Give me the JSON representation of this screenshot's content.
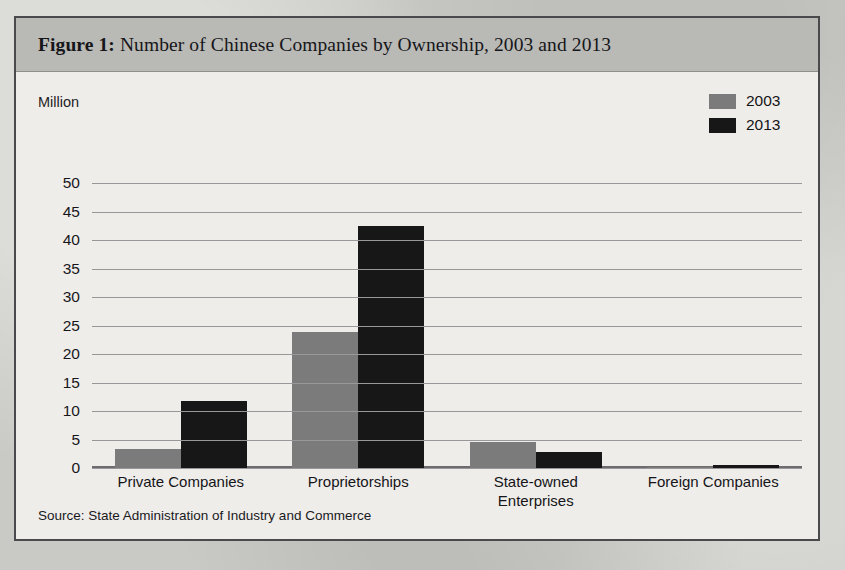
{
  "figure": {
    "label": "Figure 1:",
    "title": " Number of Chinese Companies by Ownership, 2003 and 2013",
    "unit_label": "Million",
    "source": "Source: State Administration of Industry and Commerce"
  },
  "legend": {
    "items": [
      {
        "label": "2003",
        "color": "#7b7b7b"
      },
      {
        "label": "2013",
        "color": "#171717"
      }
    ]
  },
  "chart_data": {
    "type": "bar",
    "title": "Figure 1: Number of Chinese Companies by Ownership, 2003 and 2013",
    "xlabel": "",
    "ylabel": "Million",
    "ylim": [
      0,
      50
    ],
    "yticks": [
      50,
      45,
      40,
      35,
      30,
      25,
      20,
      15,
      10,
      5,
      0
    ],
    "grid": true,
    "legend_position": "top-right",
    "categories": [
      "Private Companies",
      "Proprietorships",
      "State-owned Enterprises",
      "Foreign Companies"
    ],
    "category_lines": [
      [
        "Private Companies"
      ],
      [
        "Proprietorships"
      ],
      [
        "State-owned",
        "Enterprises"
      ],
      [
        "Foreign Companies"
      ]
    ],
    "series": [
      {
        "name": "2003",
        "color": "#7b7b7b",
        "values": [
          3.3,
          23.8,
          4.6,
          0.25
        ]
      },
      {
        "name": "2013",
        "color": "#171717",
        "values": [
          11.8,
          42.5,
          2.8,
          0.45
        ]
      }
    ],
    "annotation": "Source: State Administration of Industry and Commerce"
  },
  "bleed_text": [
    {
      "t": "in the largest five state-owned banks.",
      "x": 250,
      "y": 112,
      "s": 16
    },
    {
      "t": "and Sherry, who owns China’s business sector and whose banks",
      "x": 200,
      "y": 140,
      "s": 16
    },
    {
      "t": "the privately owned firms has accelerated in the past decade.",
      "x": 230,
      "y": 168,
      "s": 16
    },
    {
      "t": "by 2013, the number of private companies had risen to nearly",
      "x": 215,
      "y": 224,
      "s": 16
    },
    {
      "t": "remained at roughly 4.6 million, accounting for 1 percent of all",
      "x": 225,
      "y": 252,
      "s": 16
    },
    {
      "t": "state sector. Industry is no longer the exclusive province of",
      "x": 210,
      "y": 340,
      "s": 16
    },
    {
      "t": "itself and are regularly outperformed by",
      "x": 250,
      "y": 368,
      "s": 16
    },
    {
      "t": "when a new generation of managers took the helm,",
      "x": 240,
      "y": 492,
      "s": 16
    },
    {
      "t": "the banks for refusing to lend to private firms.",
      "x": 250,
      "y": 520,
      "s": 16
    }
  ]
}
